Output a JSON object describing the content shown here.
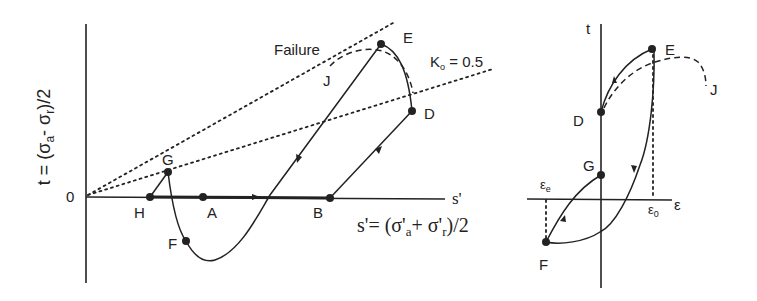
{
  "left_plot": {
    "y_axis_label": "t = (σa- σr)/2",
    "y_axis_label_parts": {
      "t": "t = (σ",
      "a": "a",
      "mid": "- σ",
      "r": "r",
      "end": ")/2"
    },
    "x_axis_symbol": "s'",
    "x_axis_label_parts": {
      "start": "s'= (σ'",
      "a": "a",
      "mid": "+ σ'",
      "r": "r",
      "end": ")/2"
    },
    "origin_label": "0",
    "lines": {
      "failure_label": "Failure",
      "k0_label_k": "K",
      "k0_label_sub": "o",
      "k0_label_value": " = 0.5"
    },
    "points": {
      "A": "A",
      "B": "B",
      "D": "D",
      "E": "E",
      "F": "F",
      "G": "G",
      "H": "H",
      "J": "J"
    }
  },
  "right_plot": {
    "y_axis_label": "t",
    "x_axis_label": "ε",
    "eps_e": {
      "main": "ε",
      "sub": "e"
    },
    "eps_0": {
      "main": "ε",
      "sub": "0"
    },
    "points": {
      "D": "D",
      "E": "E",
      "F": "F",
      "G": "G",
      "J": "J"
    }
  }
}
